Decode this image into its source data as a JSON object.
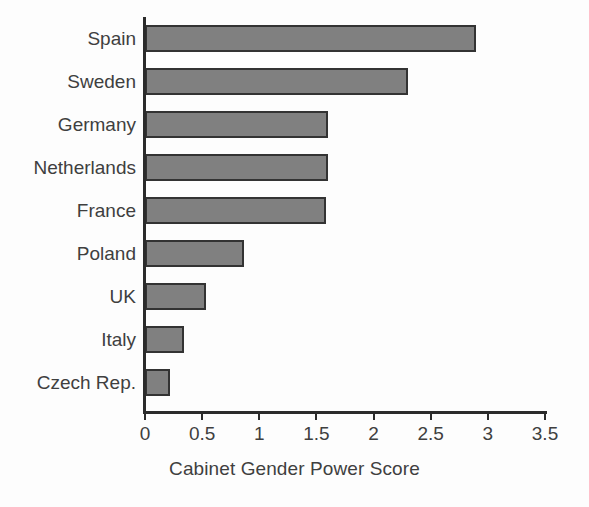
{
  "chart_data": {
    "type": "bar",
    "orientation": "horizontal",
    "title": "",
    "xlabel": "Cabinet Gender Power Score",
    "ylabel": "",
    "categories": [
      "Spain",
      "Sweden",
      "Germany",
      "Netherlands",
      "France",
      "Poland",
      "UK",
      "Italy",
      "Czech Rep."
    ],
    "values": [
      2.9,
      2.3,
      1.6,
      1.6,
      1.58,
      0.87,
      0.53,
      0.34,
      0.22
    ],
    "series": [
      {
        "name": "Cabinet Gender Power Score",
        "values": [
          2.9,
          2.3,
          1.6,
          1.6,
          1.58,
          0.87,
          0.53,
          0.34,
          0.22
        ]
      }
    ],
    "xlim": [
      0,
      3.5
    ],
    "xticks": [
      0,
      0.5,
      1,
      1.5,
      2,
      2.5,
      3,
      3.5
    ],
    "xtick_labels": [
      "0",
      "0.5",
      "1",
      "1.5",
      "2",
      "2.5",
      "3",
      "3.5"
    ],
    "grid": false,
    "legend": false,
    "bar_fill_color": "#808080",
    "bar_edge_color": "#333333",
    "axis_color": "#2b2b2b",
    "text_color": "#3f3f3f",
    "background_color": "#fdfdfd"
  }
}
